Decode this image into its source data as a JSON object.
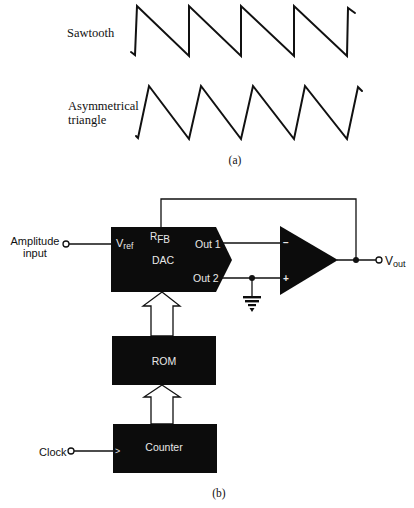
{
  "part_a": {
    "caption": "(a)",
    "waveforms": [
      {
        "label_lines": [
          "Sawtooth"
        ],
        "shape": "sawtooth",
        "points": [
          [
            131,
            52
          ],
          [
            135,
            55
          ],
          [
            137,
            6
          ],
          [
            189,
            56
          ],
          [
            189,
            6
          ],
          [
            241,
            56
          ],
          [
            241,
            6
          ],
          [
            294,
            56
          ],
          [
            294,
            6
          ],
          [
            347,
            56
          ],
          [
            348,
            8
          ],
          [
            355,
            13
          ]
        ]
      },
      {
        "label_lines": [
          "Asymmetrical",
          "triangle"
        ],
        "shape": "asymmetrical-triangle",
        "points": [
          [
            136,
            136
          ],
          [
            138,
            138
          ],
          [
            149,
            86
          ],
          [
            189,
            139
          ],
          [
            201,
            86
          ],
          [
            241,
            139
          ],
          [
            253,
            86
          ],
          [
            294,
            139
          ],
          [
            305,
            86
          ],
          [
            347,
            139
          ],
          [
            358,
            87
          ],
          [
            362,
            91
          ]
        ]
      }
    ]
  },
  "part_b": {
    "caption": "(b)",
    "inputs": {
      "amplitude": {
        "line1": "Amplitude",
        "line2": "input"
      },
      "clock": {
        "label": "Clock"
      }
    },
    "output": {
      "main": "V",
      "sub": "out"
    },
    "dac": {
      "name": "DAC",
      "vref_main": "V",
      "vref_sub": "ref",
      "rfb_main": "R",
      "rfb_sub": "FB",
      "out1": "Out 1",
      "out2": "Out 2"
    },
    "rom": {
      "name": "ROM"
    },
    "counter": {
      "name": "Counter",
      "clock_marker": ">"
    },
    "opamp": {
      "inverting": "−",
      "noninverting": "+"
    }
  }
}
